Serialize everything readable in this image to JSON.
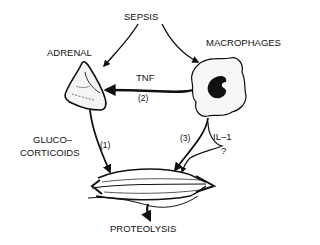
{
  "diagram": {
    "nodes": {
      "sepsis": "SEPSIS",
      "adrenal": "ADRENAL",
      "macrophages": "MACROPHAGES",
      "glucocorticoids_line1": "GLUCO–",
      "glucocorticoids_line2": "CORTICOIDS",
      "proteolysis": "PROTEOLYSIS"
    },
    "edges": {
      "tnf": "TNF",
      "path2": "(2)",
      "path1": "(1)",
      "path3": "(3)",
      "il1": "IL–1",
      "unknown": "?"
    },
    "colors": {
      "ink": "#111111",
      "background": "#ffffff"
    }
  }
}
